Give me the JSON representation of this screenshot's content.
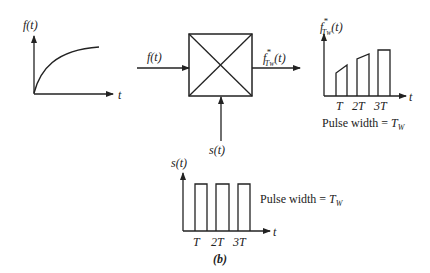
{
  "figure": {
    "caption": "(b)",
    "left_plot": {
      "ylabel": "f(t)",
      "xlabel": "t"
    },
    "block": {
      "input_label": "f(t)",
      "control_label": "s(t)",
      "output_label_main": "f",
      "output_label_sub": "T",
      "output_label_subsub": "W",
      "output_label_sup": "*",
      "output_label_tail": "(t)"
    },
    "right_plot": {
      "ylabel_main": "f",
      "ylabel_sub": "T",
      "ylabel_subsub": "W",
      "ylabel_sup": "*",
      "ylabel_tail": "(t)",
      "xlabel": "t",
      "ticks": [
        "T",
        "2T",
        "3T"
      ],
      "note_prefix": "Pulse width = ",
      "note_var": "T",
      "note_sub": "W"
    },
    "bottom_plot": {
      "ylabel": "s(t)",
      "xlabel": "t",
      "ticks": [
        "T",
        "2T",
        "3T"
      ],
      "note_prefix": "Pulse width = ",
      "note_var": "T",
      "note_sub": "W"
    }
  },
  "colors": {
    "stroke": "#222222",
    "background": "#ffffff"
  }
}
